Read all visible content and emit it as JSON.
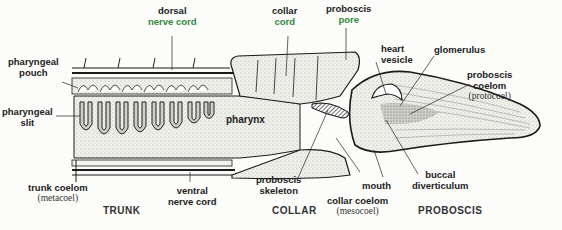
{
  "diagram": {
    "labels": {
      "dorsal_nerve_cord": {
        "line1": "dorsal",
        "line2": "nerve cord"
      },
      "collar_cord": {
        "line1": "collar",
        "line2": "cord"
      },
      "proboscis_pore": {
        "line1": "proboscis",
        "line2": "pore"
      },
      "heart_vesicle": {
        "line1": "heart",
        "line2": "vesicle"
      },
      "glomerulus": {
        "line1": "glomerulus"
      },
      "proboscis_coelom": {
        "line1": "proboscis",
        "line2": "coelom",
        "line3": "(protocoel)"
      },
      "pharyngeal_pouch": {
        "line1": "pharyngeal",
        "line2": "pouch"
      },
      "pharyngeal_slit": {
        "line1": "pharyngeal",
        "line2": "slit"
      },
      "pharynx": {
        "line1": "pharynx"
      },
      "trunk_coelom": {
        "line1": "trunk coelom",
        "line2": "(metacoel)"
      },
      "ventral_nerve_cord": {
        "line1": "ventral",
        "line2": "nerve cord"
      },
      "proboscis_skeleton": {
        "line1": "proboscis",
        "line2": "skeleton"
      },
      "mouth": {
        "line1": "mouth"
      },
      "collar_coelom": {
        "line1": "collar coelom",
        "line2": "(mesocoel)"
      },
      "buccal_diverticulum": {
        "line1": "buccal",
        "line2": "diverticulum"
      }
    },
    "sections": {
      "trunk": "TRUNK",
      "collar": "COLLAR",
      "proboscis": "PROBOSCIS"
    },
    "colors": {
      "outline": "#1a1a1a",
      "stipple_fill": "#e6e6e0",
      "green_label": "#2e8b3a"
    }
  }
}
